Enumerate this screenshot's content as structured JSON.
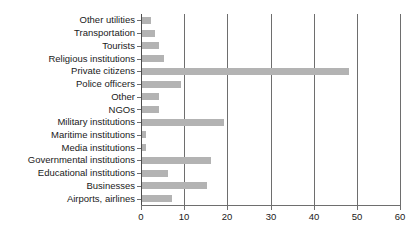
{
  "chart_data": {
    "type": "bar",
    "orientation": "horizontal",
    "title": "",
    "xlabel": "",
    "ylabel": "",
    "xlim": [
      0,
      60
    ],
    "xticks": [
      0,
      10,
      20,
      30,
      40,
      50,
      60
    ],
    "grid": true,
    "legend": null,
    "bar_color": "#b3b3b3",
    "axis_color": "#6e6e6e",
    "categories": [
      "Other utilities",
      "Transportation",
      "Tourists",
      "Religious institutions",
      "Private citizens",
      "Police officers",
      "Other",
      "NGOs",
      "Military institutions",
      "Maritime institutions",
      "Media institutions",
      "Governmental institutions",
      "Educational institutions",
      "Businesses",
      "Airports, airlines"
    ],
    "values": [
      2,
      3,
      4,
      5,
      48,
      9,
      4,
      4,
      19,
      1,
      1,
      16,
      6,
      15,
      7
    ]
  }
}
